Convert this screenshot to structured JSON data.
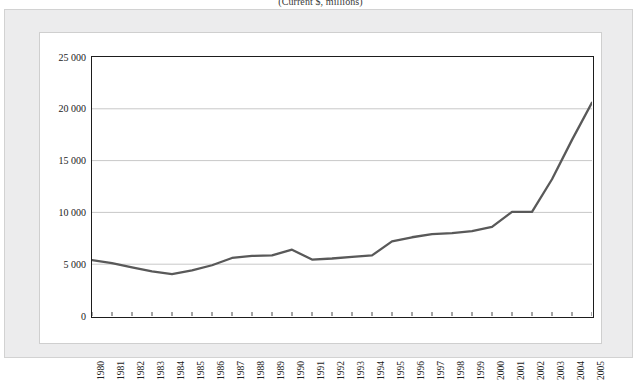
{
  "figure": {
    "subtitle": "(Current $, millions)"
  },
  "chart_data": {
    "type": "line",
    "title": "",
    "subtitle": "(Current $, millions)",
    "xlabel": "",
    "ylabel": "",
    "categories": [
      "1980",
      "1981",
      "1982",
      "1983",
      "1984",
      "1985",
      "1986",
      "1987",
      "1988",
      "1989",
      "1990",
      "1991",
      "1992",
      "1993",
      "1994",
      "1995",
      "1996",
      "1997",
      "1998",
      "1999",
      "2000",
      "2001",
      "2002",
      "2003",
      "2004",
      "2005"
    ],
    "values": [
      5400,
      5100,
      4700,
      4300,
      4050,
      4400,
      4900,
      5600,
      5800,
      5850,
      6400,
      5450,
      5550,
      5700,
      5850,
      7200,
      7600,
      7900,
      8000,
      8200,
      8600,
      10050,
      10050,
      13200,
      17000,
      20600
    ],
    "ylim": [
      0,
      25000
    ],
    "yticks": [
      0,
      5000,
      10000,
      15000,
      20000,
      25000
    ],
    "ytick_labels": [
      "0",
      "5 000",
      "10 000",
      "15 000",
      "20 000",
      "25 000"
    ],
    "grid": true,
    "grid_axis": "y",
    "legend": false,
    "legend_position": "none",
    "series": [
      {
        "name": "value",
        "color": "#595959",
        "values": [
          5400,
          5100,
          4700,
          4300,
          4050,
          4400,
          4900,
          5600,
          5800,
          5850,
          6400,
          5450,
          5550,
          5700,
          5850,
          7200,
          7600,
          7900,
          8000,
          8200,
          8600,
          10050,
          10050,
          13200,
          17000,
          20600
        ]
      }
    ]
  },
  "style": {
    "line_color": "#595959",
    "grid_color": "#c8c8c8",
    "axis_color": "#1d1d1d",
    "panel_background": "#ffffff",
    "frame_background": "#ececed"
  }
}
